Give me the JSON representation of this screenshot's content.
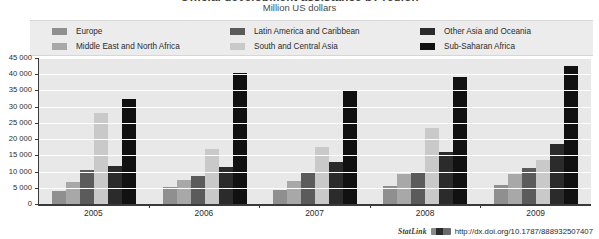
{
  "figure": {
    "clipped_title": "Official development assistance by region",
    "subtitle": "Million US dollars"
  },
  "legend": {
    "columns": [
      [
        {
          "label": "Europe",
          "color": "#8f8f8f",
          "key": "europe"
        },
        {
          "label": "Middle East and North Africa",
          "color": "#a8a8a8",
          "key": "middle-east-and-north-africa"
        }
      ],
      [
        {
          "label": "Latin America and Caribbean",
          "color": "#5b5b5b",
          "key": "latin-america-and-caribbean"
        },
        {
          "label": "South and Central Asia",
          "color": "#c9c9c9",
          "key": "south-and-central-asia"
        }
      ],
      [
        {
          "label": "Other Asia and Oceania",
          "color": "#2b2b2b",
          "key": "other-asia-and-oceania"
        },
        {
          "label": "Sub-Saharan Africa",
          "color": "#111111",
          "key": "sub-saharan-africa"
        }
      ]
    ]
  },
  "axes": {
    "y_ticks": [
      "45 000",
      "40 000",
      "35 000",
      "30 000",
      "25 000",
      "20 000",
      "15 000",
      "10 000",
      "5 000",
      "0"
    ],
    "y_tick_values": [
      45000,
      40000,
      35000,
      30000,
      25000,
      20000,
      15000,
      10000,
      5000,
      0
    ],
    "x_labels": [
      "2005",
      "2006",
      "2007",
      "2008",
      "2009"
    ]
  },
  "footer": {
    "statlink_word": "StatLink",
    "statlink_url": "http://dx.doi.org/10.1787/888932507407"
  },
  "chart_data": {
    "type": "bar",
    "title": "Official development assistance by region",
    "subtitle": "Million US dollars",
    "xlabel": "",
    "ylabel": "Million US dollars",
    "ylim": [
      0,
      45000
    ],
    "ytick_step": 5000,
    "grid": true,
    "legend_position": "top",
    "categories": [
      "2005",
      "2006",
      "2007",
      "2008",
      "2009"
    ],
    "series": [
      {
        "name": "Europe",
        "color": "#8f8f8f",
        "values": [
          4100,
          5100,
          4300,
          5500,
          5900
        ]
      },
      {
        "name": "Middle East and North Africa",
        "color": "#a8a8a8",
        "values": [
          6700,
          7300,
          7100,
          9300,
          9200
        ]
      },
      {
        "name": "Latin America and Caribbean",
        "color": "#5b5b5b",
        "values": [
          10600,
          8700,
          9700,
          9900,
          11100
        ]
      },
      {
        "name": "South and Central Asia",
        "color": "#c9c9c9",
        "values": [
          28200,
          17000,
          17700,
          23300,
          13700
        ]
      },
      {
        "name": "Other Asia and Oceania",
        "color": "#2b2b2b",
        "values": [
          11700,
          11400,
          13100,
          16100,
          18400
        ]
      },
      {
        "name": "Sub-Saharan Africa",
        "color": "#111111",
        "values": [
          32400,
          40400,
          34700,
          39300,
          42400
        ]
      }
    ]
  }
}
